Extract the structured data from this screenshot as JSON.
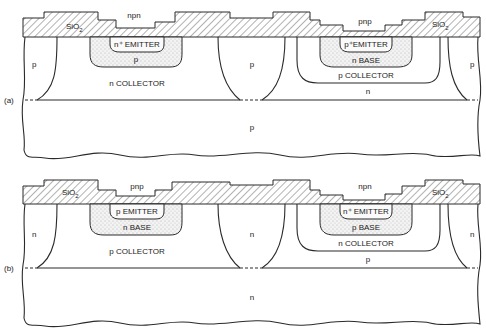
{
  "figure": {
    "panels": [
      {
        "id": "a",
        "label": "(a)",
        "oxide_label": "SiO",
        "oxide_sub": "2",
        "left_device": {
          "type_label": "npn",
          "emitter_label": "n⁺ EMITTER",
          "base_label": "p",
          "collector_label": "n COLLECTOR"
        },
        "right_device": {
          "type_label": "pnp",
          "emitter_label": "p⁺EMITTER",
          "base_label": "n BASE",
          "collector_label": "p COLLECTOR",
          "well_label": "n"
        },
        "isolation_labels": [
          "p",
          "p",
          "p"
        ],
        "substrate_label": "p"
      },
      {
        "id": "b",
        "label": "(b)",
        "oxide_label": "SiO",
        "oxide_sub": "2",
        "left_device": {
          "type_label": "pnp",
          "emitter_label": "p EMITTER",
          "base_label": "n BASE",
          "collector_label": "p COLLECTOR"
        },
        "right_device": {
          "type_label": "npn",
          "emitter_label": "n⁺ EMITTER",
          "base_label": "p BASE",
          "collector_label": "n COLLECTOR",
          "well_label": "p"
        },
        "isolation_labels": [
          "n",
          "n",
          "n"
        ],
        "substrate_label": "n"
      }
    ]
  }
}
